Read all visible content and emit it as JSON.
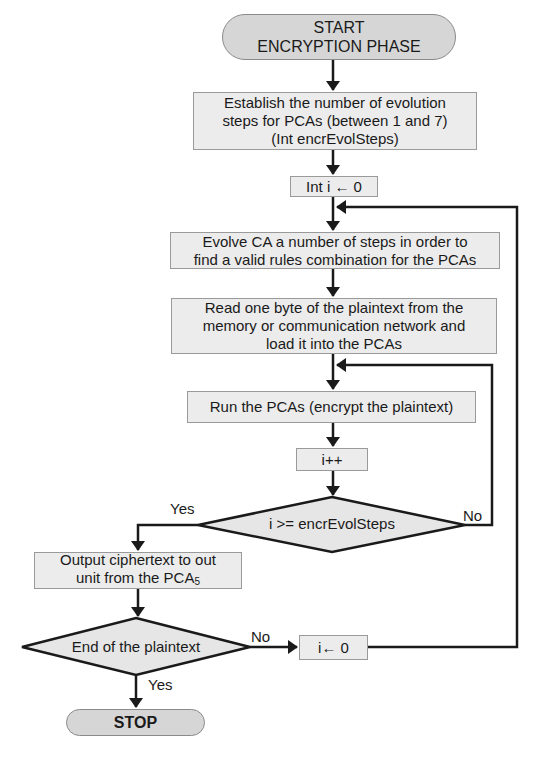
{
  "flowchart": {
    "start": {
      "line1": "START",
      "line2": "ENCRYPTION PHASE"
    },
    "establish": {
      "line1": "Establish the number of evolution",
      "line2": "steps for PCAs (between 1 and 7)",
      "line3": "(Int encrEvolSteps)"
    },
    "init_i": {
      "text": "Int i ←  0"
    },
    "evolve": {
      "line1": "Evolve CA a number of steps in order to",
      "line2": "find a valid rules combination for the PCAs"
    },
    "read": {
      "line1": "Read one byte of the plaintext from the",
      "line2": "memory or communication network and",
      "line3": "load it into the PCAs"
    },
    "run": {
      "text": "Run the PCAs (encrypt the plaintext)"
    },
    "increment": {
      "text": "i++"
    },
    "decision1": {
      "text": "i >= encrEvolSteps",
      "yes_label": "Yes",
      "no_label": "No"
    },
    "output": {
      "line1": "Output ciphertext to out",
      "line2_prefix": "unit from the PCA",
      "line2_sub": "5"
    },
    "decision2": {
      "text": "End of the plaintext",
      "yes_label": "Yes",
      "no_label": "No"
    },
    "reset_i": {
      "text": "i← 0"
    },
    "stop": {
      "text": "STOP"
    }
  },
  "colors": {
    "box_fill": "#ececec",
    "terminal_fill": "#d6d6d6",
    "line": "#1a1a1a"
  }
}
